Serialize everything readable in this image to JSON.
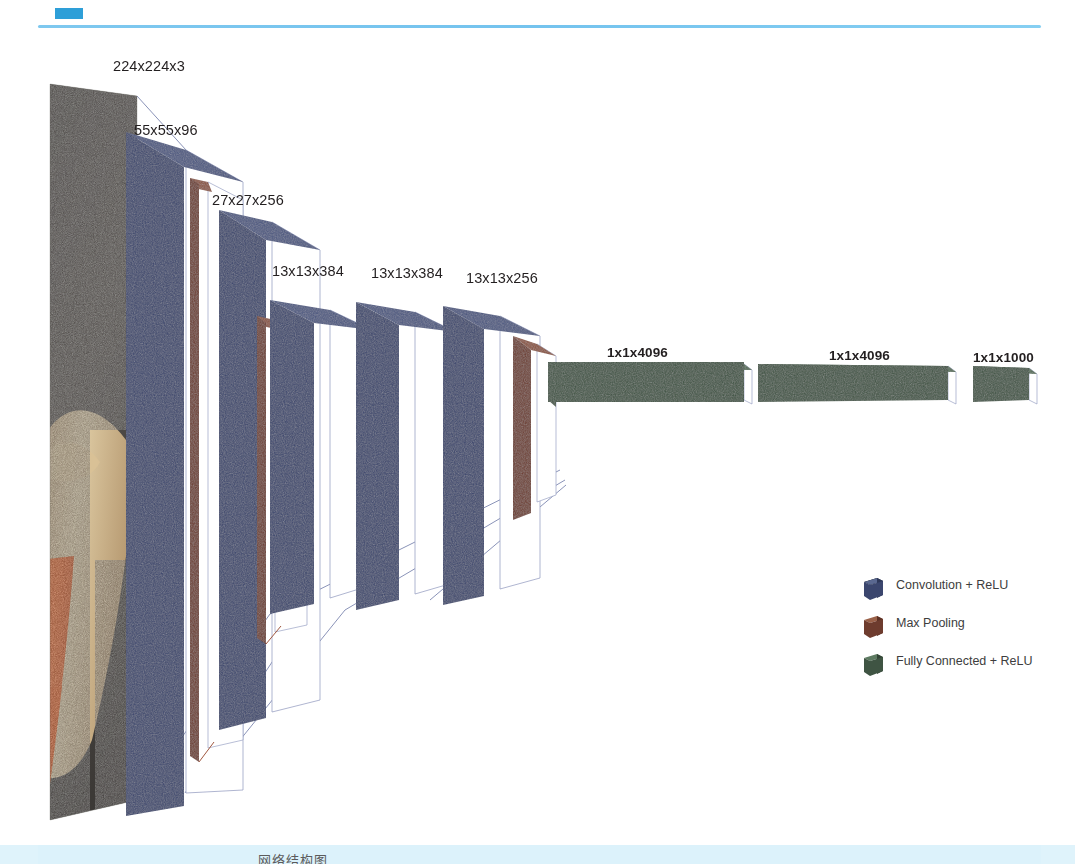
{
  "page": {
    "background_color": "#ffffff",
    "top_rule_color": "#7ec8ef",
    "bottom_strip_color": "#dcf2fb",
    "bottom_swatch_color": "#2e9fd8",
    "bottom_caption_partial": "网络结构图"
  },
  "colors": {
    "convolution": "#3b466e",
    "convolution_top": "#4b5781",
    "convolution_side": "#2e3859",
    "max_pooling": "#6e3c2e",
    "max_pooling_top": "#8a5340",
    "max_pooling_side": "#5a3024",
    "fully_connected": "#3f5443",
    "fully_connected_top": "#516b55",
    "fully_connected_side": "#334436",
    "guide_line": "#8a93b8",
    "label_text": "#231f20",
    "legend_text": "#3d3d3d"
  },
  "diagram": {
    "type": "cnn-architecture",
    "name": "AlexNet",
    "input": {
      "label": "224x224x3",
      "kind": "input-image",
      "description": "photograph of an animal on gravel"
    },
    "layers": [
      {
        "id": "conv1",
        "label": "55x55x96",
        "kind": "convolution",
        "legend": "Convolution + ReLU"
      },
      {
        "id": "pool1",
        "label": "",
        "kind": "max-pooling",
        "legend": "Max Pooling"
      },
      {
        "id": "conv2",
        "label": "27x27x256",
        "kind": "convolution",
        "legend": "Convolution + ReLU"
      },
      {
        "id": "pool2",
        "label": "",
        "kind": "max-pooling",
        "legend": "Max Pooling"
      },
      {
        "id": "conv3",
        "label": "13x13x384",
        "kind": "convolution",
        "legend": "Convolution + ReLU"
      },
      {
        "id": "conv4",
        "label": "13x13x384",
        "kind": "convolution",
        "legend": "Convolution + ReLU"
      },
      {
        "id": "conv5",
        "label": "13x13x256",
        "kind": "convolution",
        "legend": "Convolution + ReLU"
      },
      {
        "id": "pool3",
        "label": "",
        "kind": "max-pooling",
        "legend": "Max Pooling"
      },
      {
        "id": "fc6",
        "label": "1x1x4096",
        "kind": "fully-connected",
        "legend": "Fully Connected + ReLU"
      },
      {
        "id": "fc7",
        "label": "1x1x4096",
        "kind": "fully-connected",
        "legend": "Fully Connected + ReLU"
      },
      {
        "id": "fc8",
        "label": "1x1x1000",
        "kind": "fully-connected",
        "legend": "Fully Connected + ReLU"
      }
    ]
  },
  "labels": {
    "input": "224x224x3",
    "conv1": "55x55x96",
    "conv2": "27x27x256",
    "conv3": "13x13x384",
    "conv4": "13x13x384",
    "conv5": "13x13x256",
    "fc6": "1x1x4096",
    "fc7": "1x1x4096",
    "fc8": "1x1x1000"
  },
  "legend": {
    "items": [
      {
        "label": "Convolution + ReLU",
        "color": "#3b466e",
        "icon": "cube-icon"
      },
      {
        "label": "Max Pooling",
        "color": "#6e3c2e",
        "icon": "cube-icon"
      },
      {
        "label": "Fully Connected + ReLU",
        "color": "#3f5443",
        "icon": "cube-icon"
      }
    ]
  }
}
